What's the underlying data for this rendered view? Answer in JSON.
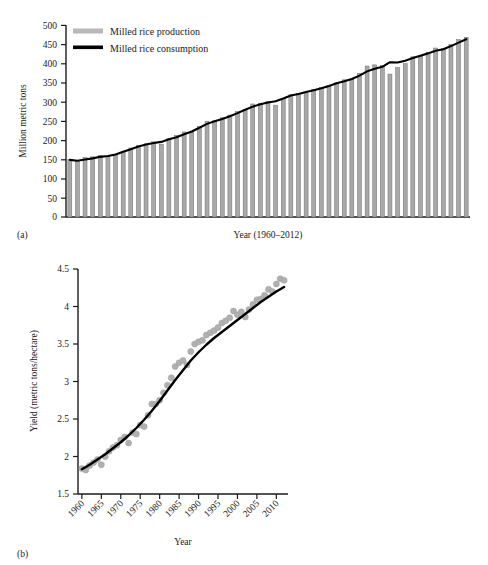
{
  "figure": {
    "panel_a_label": "(a)",
    "panel_b_label": "(b)"
  },
  "chart_data": [
    {
      "id": "panel_a",
      "type": "bar",
      "title": "",
      "xlabel": "Year (1960–2012)",
      "ylabel": "Million metric tons",
      "ylim": [
        0,
        500
      ],
      "yticks": [
        0,
        50,
        100,
        150,
        200,
        250,
        300,
        350,
        400,
        450,
        500
      ],
      "grid": false,
      "legend_position": "top-left",
      "legend": [
        "Milled rice production",
        "Milled rice consumption"
      ],
      "x": [
        1960,
        1961,
        1962,
        1963,
        1964,
        1965,
        1966,
        1967,
        1968,
        1969,
        1970,
        1971,
        1972,
        1973,
        1974,
        1975,
        1976,
        1977,
        1978,
        1979,
        1980,
        1981,
        1982,
        1983,
        1984,
        1985,
        1986,
        1987,
        1988,
        1989,
        1990,
        1991,
        1992,
        1993,
        1994,
        1995,
        1996,
        1997,
        1998,
        1999,
        2000,
        2001,
        2002,
        2003,
        2004,
        2005,
        2006,
        2007,
        2008,
        2009,
        2010,
        2011,
        2012
      ],
      "series": [
        {
          "name": "Milled rice production",
          "type": "bar",
          "color": "#a8a8a8",
          "values": [
            150,
            148,
            155,
            157,
            161,
            158,
            163,
            171,
            180,
            186,
            191,
            196,
            190,
            205,
            213,
            222,
            221,
            236,
            250,
            251,
            259,
            266,
            275,
            281,
            295,
            297,
            301,
            292,
            309,
            319,
            323,
            324,
            333,
            338,
            343,
            350,
            358,
            360,
            375,
            394,
            397,
            395,
            373,
            390,
            400,
            418,
            420,
            430,
            441,
            440,
            450,
            463,
            469
          ]
        },
        {
          "name": "Milled rice consumption",
          "type": "line",
          "color": "#000000",
          "values": [
            149,
            147,
            150,
            153,
            157,
            159,
            163,
            170,
            177,
            184,
            189,
            193,
            196,
            203,
            208,
            216,
            223,
            233,
            243,
            250,
            256,
            263,
            271,
            280,
            288,
            294,
            299,
            302,
            309,
            317,
            321,
            326,
            331,
            336,
            342,
            349,
            354,
            360,
            369,
            380,
            387,
            392,
            404,
            403,
            408,
            415,
            421,
            427,
            434,
            438,
            446,
            455,
            464
          ]
        }
      ]
    },
    {
      "id": "panel_b",
      "type": "scatter",
      "title": "",
      "xlabel": "Year",
      "ylabel": "Yield (metric tons/hectare)",
      "ylim": [
        1.5,
        4.5
      ],
      "yticks": [
        1.5,
        2.0,
        2.5,
        3.0,
        3.5,
        4.0,
        4.5
      ],
      "xlim": [
        1959,
        2013
      ],
      "xticks": [
        1960,
        1965,
        1970,
        1975,
        1980,
        1985,
        1990,
        1995,
        2000,
        2005,
        2010
      ],
      "grid": false,
      "legend_position": "none",
      "series": [
        {
          "name": "Observed yield",
          "type": "scatter",
          "color": "#b0b0b0",
          "x": [
            1960,
            1961,
            1962,
            1963,
            1964,
            1965,
            1966,
            1967,
            1968,
            1969,
            1970,
            1971,
            1972,
            1973,
            1974,
            1975,
            1976,
            1977,
            1978,
            1979,
            1980,
            1981,
            1982,
            1983,
            1984,
            1985,
            1986,
            1987,
            1988,
            1989,
            1990,
            1991,
            1992,
            1993,
            1994,
            1995,
            1996,
            1997,
            1998,
            1999,
            2000,
            2001,
            2002,
            2003,
            2004,
            2005,
            2006,
            2007,
            2008,
            2009,
            2010,
            2011,
            2012
          ],
          "y": [
            1.84,
            1.82,
            1.88,
            1.92,
            1.96,
            1.89,
            2.0,
            2.07,
            2.12,
            2.15,
            2.22,
            2.26,
            2.18,
            2.32,
            2.3,
            2.42,
            2.4,
            2.55,
            2.7,
            2.7,
            2.75,
            2.85,
            2.95,
            3.05,
            3.2,
            3.25,
            3.28,
            3.22,
            3.4,
            3.5,
            3.53,
            3.55,
            3.62,
            3.65,
            3.68,
            3.72,
            3.78,
            3.81,
            3.85,
            3.94,
            3.89,
            3.93,
            3.86,
            3.96,
            4.03,
            4.09,
            4.1,
            4.15,
            4.23,
            4.2,
            4.3,
            4.37,
            4.35
          ]
        },
        {
          "name": "Fitted trend",
          "type": "line",
          "color": "#000000",
          "x": [
            1960,
            1962,
            1964,
            1966,
            1968,
            1970,
            1972,
            1974,
            1976,
            1978,
            1980,
            1982,
            1984,
            1986,
            1988,
            1990,
            1992,
            1994,
            1996,
            1998,
            2000,
            2002,
            2004,
            2006,
            2008,
            2010,
            2012
          ],
          "y": [
            1.83,
            1.89,
            1.96,
            2.03,
            2.11,
            2.19,
            2.28,
            2.38,
            2.49,
            2.61,
            2.74,
            2.88,
            3.02,
            3.15,
            3.28,
            3.39,
            3.49,
            3.58,
            3.66,
            3.74,
            3.82,
            3.9,
            3.98,
            4.06,
            4.13,
            4.2,
            4.26
          ]
        }
      ]
    }
  ]
}
